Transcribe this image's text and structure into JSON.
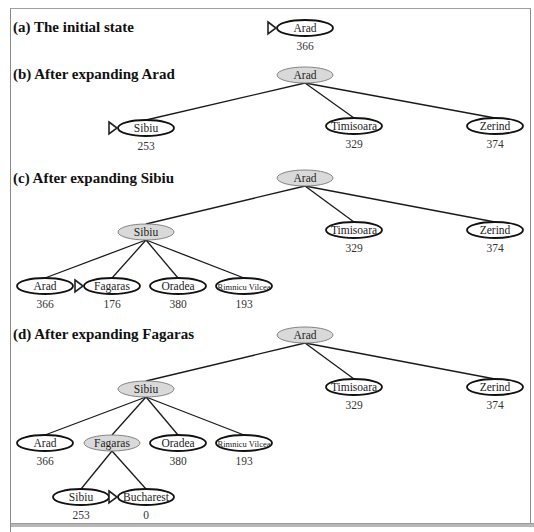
{
  "panels": [
    {
      "id": "a",
      "label": "(a) The initial state"
    },
    {
      "id": "b",
      "label": "(b) After expanding Arad"
    },
    {
      "id": "c",
      "label": "(c) After expanding Sibiu"
    },
    {
      "id": "d",
      "label": "(d) After expanding Fagaras"
    }
  ],
  "colors": {
    "expanded_fill": "#d9d9d9",
    "frontier_fill": "#ffffff",
    "edge": "#1a1a1a",
    "border": "#8a8a8a"
  },
  "nodes": [
    {
      "panel": "a",
      "name": "Arad",
      "value": "366",
      "cx": 305,
      "cy": 28,
      "expanded": false,
      "selected": true
    },
    {
      "panel": "b",
      "name": "Arad",
      "value": "",
      "cx": 305,
      "cy": 75,
      "expanded": true,
      "selected": false
    },
    {
      "panel": "b",
      "name": "Sibiu",
      "value": "253",
      "cx": 146,
      "cy": 128,
      "expanded": false,
      "selected": true
    },
    {
      "panel": "b",
      "name": "Timisoara",
      "value": "329",
      "cx": 354,
      "cy": 126,
      "expanded": false,
      "selected": false
    },
    {
      "panel": "b",
      "name": "Zerind",
      "value": "374",
      "cx": 495,
      "cy": 126,
      "expanded": false,
      "selected": false
    },
    {
      "panel": "c",
      "name": "Arad",
      "value": "",
      "cx": 305,
      "cy": 178,
      "expanded": true,
      "selected": false
    },
    {
      "panel": "c",
      "name": "Sibiu",
      "value": "",
      "cx": 146,
      "cy": 232,
      "expanded": true,
      "selected": false
    },
    {
      "panel": "c",
      "name": "Timisoara",
      "value": "329",
      "cx": 354,
      "cy": 230,
      "expanded": false,
      "selected": false
    },
    {
      "panel": "c",
      "name": "Zerind",
      "value": "374",
      "cx": 495,
      "cy": 230,
      "expanded": false,
      "selected": false
    },
    {
      "panel": "c",
      "name": "Arad",
      "value": "366",
      "cx": 45,
      "cy": 286,
      "expanded": false,
      "selected": false
    },
    {
      "panel": "c",
      "name": "Fagaras",
      "value": "176",
      "cx": 112,
      "cy": 286,
      "expanded": false,
      "selected": true
    },
    {
      "panel": "c",
      "name": "Oradea",
      "value": "380",
      "cx": 178,
      "cy": 286,
      "expanded": false,
      "selected": false
    },
    {
      "panel": "c",
      "name": "Rimnicu Vilcea",
      "value": "193",
      "cx": 244,
      "cy": 286,
      "expanded": false,
      "selected": false
    },
    {
      "panel": "d",
      "name": "Arad",
      "value": "",
      "cx": 305,
      "cy": 335,
      "expanded": true,
      "selected": false
    },
    {
      "panel": "d",
      "name": "Sibiu",
      "value": "",
      "cx": 146,
      "cy": 389,
      "expanded": true,
      "selected": false
    },
    {
      "panel": "d",
      "name": "Timisoara",
      "value": "329",
      "cx": 354,
      "cy": 387,
      "expanded": false,
      "selected": false
    },
    {
      "panel": "d",
      "name": "Zerind",
      "value": "374",
      "cx": 495,
      "cy": 387,
      "expanded": false,
      "selected": false
    },
    {
      "panel": "d",
      "name": "Arad",
      "value": "366",
      "cx": 45,
      "cy": 443,
      "expanded": false,
      "selected": false
    },
    {
      "panel": "d",
      "name": "Fagaras",
      "value": "",
      "cx": 112,
      "cy": 443,
      "expanded": true,
      "selected": false
    },
    {
      "panel": "d",
      "name": "Oradea",
      "value": "380",
      "cx": 178,
      "cy": 443,
      "expanded": false,
      "selected": false
    },
    {
      "panel": "d",
      "name": "Rimnicu Vilcea",
      "value": "193",
      "cx": 244,
      "cy": 443,
      "expanded": false,
      "selected": false
    },
    {
      "panel": "d",
      "name": "Sibiu",
      "value": "253",
      "cx": 81,
      "cy": 497,
      "expanded": false,
      "selected": false
    },
    {
      "panel": "d",
      "name": "Bucharest",
      "value": "0",
      "cx": 146,
      "cy": 497,
      "expanded": false,
      "selected": true
    }
  ],
  "edges": [
    [
      1,
      2
    ],
    [
      1,
      3
    ],
    [
      1,
      4
    ],
    [
      5,
      6
    ],
    [
      5,
      7
    ],
    [
      5,
      8
    ],
    [
      6,
      9
    ],
    [
      6,
      10
    ],
    [
      6,
      11
    ],
    [
      6,
      12
    ],
    [
      13,
      14
    ],
    [
      13,
      15
    ],
    [
      13,
      16
    ],
    [
      14,
      17
    ],
    [
      14,
      18
    ],
    [
      14,
      19
    ],
    [
      14,
      20
    ],
    [
      18,
      21
    ],
    [
      18,
      22
    ]
  ]
}
